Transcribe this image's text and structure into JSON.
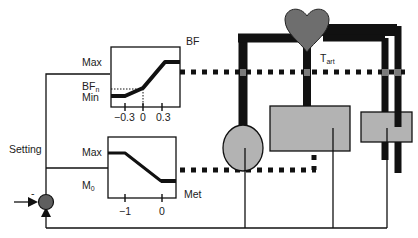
{
  "colors": {
    "line": "#111111",
    "organ_fill": "#b3b3b3",
    "heart_fill": "#6e6e6e",
    "comparator_fill": "#5f5f5f",
    "vessel_junction": "#7a7a7a",
    "background": "#ffffff"
  },
  "labels": {
    "setting": "Setting",
    "comparator_sign": "-",
    "t_art_main": "T",
    "t_art_sub": "art"
  },
  "bf_plot": {
    "title": "BF",
    "y_max": "Max",
    "y_bfn_main": "BF",
    "y_bfn_sub": "n",
    "y_min": "Min",
    "x_ticks": [
      "−0.3",
      "0",
      "0.3"
    ],
    "curve": [
      [
        -0.6,
        "Min"
      ],
      [
        -0.3,
        "Min"
      ],
      [
        0,
        "BFn"
      ],
      [
        0.3,
        "Max"
      ],
      [
        0.45,
        "Max"
      ]
    ]
  },
  "met_plot": {
    "xlabel": "Met",
    "y_max": "Max",
    "y_m0_main": "M",
    "y_m0_sub": "0",
    "x_ticks": [
      "−1",
      "0"
    ],
    "curve": [
      [
        -1.5,
        "Max"
      ],
      [
        -1.0,
        "Max"
      ],
      [
        0,
        "M0"
      ],
      [
        0.4,
        "M0"
      ]
    ]
  },
  "components": {
    "heart": "heart",
    "organ_left": "circle-organ",
    "organ_center": "rectangle-organ",
    "organ_right": "small-rectangle-organ"
  }
}
